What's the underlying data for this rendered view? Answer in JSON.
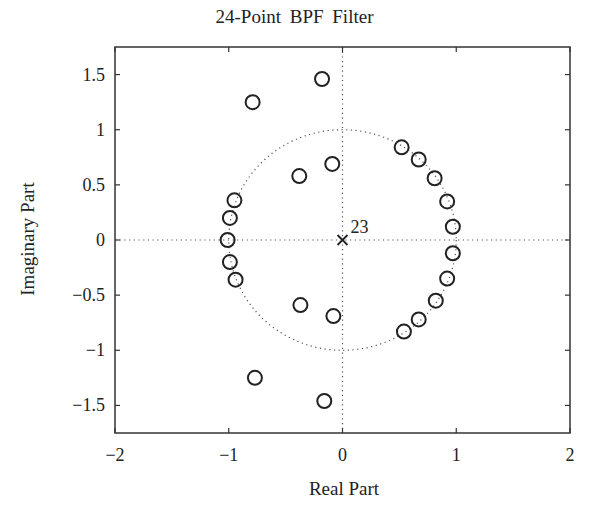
{
  "chart_data": {
    "type": "scatter",
    "title": "24-Point  BPF  Filter",
    "xlabel": "Real Part",
    "ylabel": "Imaginary Part",
    "xlim": [
      -2,
      2
    ],
    "ylim": [
      -1.75,
      1.75
    ],
    "xticks": [
      "−2",
      "−1",
      "0",
      "1",
      "2"
    ],
    "yticks": [
      "1.5",
      "1",
      "0.5",
      "0",
      "−0.5",
      "−1",
      "−1.5"
    ],
    "grid": false,
    "unit_circle": true,
    "series": [
      {
        "name": "zeros",
        "marker": "o",
        "points": [
          [
            -0.18,
            1.46
          ],
          [
            -0.79,
            1.25
          ],
          [
            -0.09,
            0.69
          ],
          [
            -0.38,
            0.58
          ],
          [
            -0.95,
            0.36
          ],
          [
            -0.99,
            0.2
          ],
          [
            -1.01,
            0.0
          ],
          [
            -0.99,
            -0.2
          ],
          [
            -0.94,
            -0.36
          ],
          [
            -0.37,
            -0.59
          ],
          [
            -0.08,
            -0.69
          ],
          [
            -0.77,
            -1.25
          ],
          [
            -0.16,
            -1.46
          ],
          [
            0.52,
            0.84
          ],
          [
            0.67,
            0.73
          ],
          [
            0.81,
            0.56
          ],
          [
            0.92,
            0.35
          ],
          [
            0.97,
            0.12
          ],
          [
            0.97,
            -0.12
          ],
          [
            0.92,
            -0.35
          ],
          [
            0.82,
            -0.55
          ],
          [
            0.67,
            -0.72
          ],
          [
            0.54,
            -0.83
          ]
        ]
      },
      {
        "name": "poles",
        "marker": "x",
        "points": [
          [
            0,
            0
          ]
        ],
        "annotation": "23"
      }
    ]
  }
}
